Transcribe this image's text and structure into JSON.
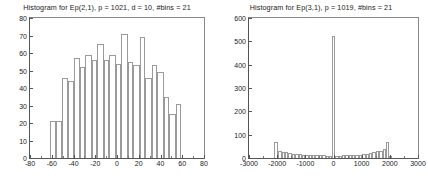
{
  "figure": {
    "background": "#ffffff",
    "axis_color": "#555555",
    "bar_edge_color": "#9a9a9a",
    "bar_fill_color": "#ffffff",
    "text_color": "#1a1a1a"
  },
  "charts": [
    {
      "id": "histogram-ep21",
      "title": "Histogram for Ep(2,1), p = 1021, d = 10, #bins = 21",
      "xticklabels": [
        "-80",
        "-60",
        "-40",
        "-20",
        "0",
        "20",
        "40",
        "60",
        "80"
      ],
      "yticklabels": [
        "0",
        "10",
        "20",
        "30",
        "40",
        "50",
        "60",
        "70",
        "80"
      ]
    },
    {
      "id": "histogram-ep31",
      "title": "Histogram for Ep(3,1), p = 1019, #bins = 21",
      "xticklabels": [
        "-3000",
        "-2000",
        "-1000",
        "0",
        "1000",
        "2000",
        "3000"
      ],
      "yticklabels": [
        "0",
        "100",
        "200",
        "300",
        "400",
        "500",
        "600"
      ]
    }
  ],
  "chart_data": [
    {
      "type": "bar",
      "id": "histogram-ep21",
      "title": "Histogram for Ep(2,1), p = 1021, d = 10, #bins = 21",
      "xlabel": "",
      "ylabel": "",
      "xlim": [
        -80,
        80
      ],
      "ylim": [
        0,
        80
      ],
      "xticks": [
        -80,
        -60,
        -40,
        -20,
        0,
        20,
        40,
        60,
        80
      ],
      "yticks": [
        0,
        10,
        20,
        30,
        40,
        50,
        60,
        70,
        80
      ],
      "grid": false,
      "legend": null,
      "bin_count": 21,
      "bin_width": 5.5,
      "bin_centers": [
        -59.5,
        -54,
        -48.5,
        -43,
        -37.5,
        -32,
        -26.5,
        -21,
        -15.5,
        -10,
        -4.5,
        1,
        6.5,
        12,
        17.5,
        23,
        28.5,
        34,
        39.5,
        45,
        50.5,
        56,
        61.5
      ],
      "categories": [
        "-62",
        "-57",
        "-51",
        "-46",
        "-40",
        "-35",
        "-29",
        "-24",
        "-18",
        "-13",
        "-7",
        "-2",
        "4",
        "9",
        "15",
        "20",
        "26",
        "31",
        "37",
        "42",
        "48",
        "53",
        "59"
      ],
      "values": [
        21,
        21,
        46,
        44,
        57,
        52,
        59,
        56,
        65,
        56,
        59,
        54,
        71,
        55,
        53,
        69,
        46,
        53,
        49,
        35,
        25,
        31
      ],
      "bars": [
        {
          "x_start": -62,
          "x_end": -56,
          "height": 21
        },
        {
          "x_start": -56,
          "x_end": -51,
          "height": 21
        },
        {
          "x_start": -51,
          "x_end": -45,
          "height": 46
        },
        {
          "x_start": -45,
          "x_end": -40,
          "height": 44
        },
        {
          "x_start": -40,
          "x_end": -34,
          "height": 57
        },
        {
          "x_start": -34,
          "x_end": -29,
          "height": 52
        },
        {
          "x_start": -29,
          "x_end": -23,
          "height": 59
        },
        {
          "x_start": -23,
          "x_end": -18,
          "height": 56
        },
        {
          "x_start": -18,
          "x_end": -12,
          "height": 65
        },
        {
          "x_start": -12,
          "x_end": -7,
          "height": 56
        },
        {
          "x_start": -7,
          "x_end": -1,
          "height": 59
        },
        {
          "x_start": -1,
          "x_end": 4,
          "height": 54
        },
        {
          "x_start": 4,
          "x_end": 10,
          "height": 71
        },
        {
          "x_start": 10,
          "x_end": 15,
          "height": 55
        },
        {
          "x_start": 15,
          "x_end": 21,
          "height": 53
        },
        {
          "x_start": 21,
          "x_end": 26,
          "height": 69
        },
        {
          "x_start": 26,
          "x_end": 32,
          "height": 46
        },
        {
          "x_start": 32,
          "x_end": 37,
          "height": 53
        },
        {
          "x_start": 37,
          "x_end": 43,
          "height": 49
        },
        {
          "x_start": 43,
          "x_end": 48,
          "height": 35
        },
        {
          "x_start": 48,
          "x_end": 54,
          "height": 25
        },
        {
          "x_start": 54,
          "x_end": 59,
          "height": 31
        }
      ]
    },
    {
      "type": "bar",
      "id": "histogram-ep31",
      "title": "Histogram for Ep(3,1), p = 1019, #bins = 21",
      "xlabel": "",
      "ylabel": "",
      "xlim": [
        -3000,
        3000
      ],
      "ylim": [
        0,
        600
      ],
      "xticks": [
        -3000,
        -2000,
        -1000,
        0,
        1000,
        2000,
        3000
      ],
      "yticks": [
        0,
        100,
        200,
        300,
        400,
        500,
        600
      ],
      "grid": false,
      "legend": null,
      "bin_count": 21,
      "categories": [
        "-2050",
        "-1900",
        "-1750",
        "-1600",
        "-1450",
        "-1300",
        "-1150",
        "-1000",
        "-850",
        "-700",
        "-550",
        "-400",
        "-250",
        "-100",
        "50",
        "200",
        "350",
        "500",
        "650",
        "800",
        "950",
        "1100",
        "1250",
        "1400",
        "1550",
        "1700",
        "1850",
        "2000"
      ],
      "values": [
        70,
        28,
        26,
        24,
        22,
        19,
        18,
        16,
        15,
        14,
        13,
        12,
        11,
        525,
        10,
        10,
        11,
        12,
        13,
        14,
        16,
        18,
        20,
        24,
        30,
        38,
        70,
        8
      ],
      "bars": [
        {
          "x_start": -2100,
          "x_end": -1960,
          "height": 70
        },
        {
          "x_start": -1960,
          "x_end": -1840,
          "height": 28
        },
        {
          "x_start": -1840,
          "x_end": -1720,
          "height": 26
        },
        {
          "x_start": -1720,
          "x_end": -1600,
          "height": 24
        },
        {
          "x_start": -1600,
          "x_end": -1480,
          "height": 22
        },
        {
          "x_start": -1480,
          "x_end": -1360,
          "height": 19
        },
        {
          "x_start": -1360,
          "x_end": -1240,
          "height": 18
        },
        {
          "x_start": -1240,
          "x_end": -1120,
          "height": 16
        },
        {
          "x_start": -1120,
          "x_end": -1000,
          "height": 15
        },
        {
          "x_start": -1000,
          "x_end": -880,
          "height": 14
        },
        {
          "x_start": -880,
          "x_end": -760,
          "height": 13
        },
        {
          "x_start": -760,
          "x_end": -640,
          "height": 12
        },
        {
          "x_start": -640,
          "x_end": -520,
          "height": 12
        },
        {
          "x_start": -520,
          "x_end": -400,
          "height": 11
        },
        {
          "x_start": -400,
          "x_end": -280,
          "height": 11
        },
        {
          "x_start": -280,
          "x_end": -160,
          "height": 10
        },
        {
          "x_start": -160,
          "x_end": -60,
          "height": 10
        },
        {
          "x_start": -60,
          "x_end": 60,
          "height": 525
        },
        {
          "x_start": 60,
          "x_end": 180,
          "height": 10
        },
        {
          "x_start": 180,
          "x_end": 300,
          "height": 10
        },
        {
          "x_start": 300,
          "x_end": 420,
          "height": 11
        },
        {
          "x_start": 420,
          "x_end": 540,
          "height": 11
        },
        {
          "x_start": 540,
          "x_end": 660,
          "height": 12
        },
        {
          "x_start": 660,
          "x_end": 780,
          "height": 13
        },
        {
          "x_start": 780,
          "x_end": 900,
          "height": 14
        },
        {
          "x_start": 900,
          "x_end": 1020,
          "height": 15
        },
        {
          "x_start": 1020,
          "x_end": 1140,
          "height": 16
        },
        {
          "x_start": 1140,
          "x_end": 1260,
          "height": 18
        },
        {
          "x_start": 1260,
          "x_end": 1380,
          "height": 20
        },
        {
          "x_start": 1380,
          "x_end": 1500,
          "height": 24
        },
        {
          "x_start": 1500,
          "x_end": 1620,
          "height": 28
        },
        {
          "x_start": 1620,
          "x_end": 1740,
          "height": 32
        },
        {
          "x_start": 1740,
          "x_end": 1860,
          "height": 38
        },
        {
          "x_start": 1860,
          "x_end": 1980,
          "height": 70
        },
        {
          "x_start": 1980,
          "x_end": 2060,
          "height": 8
        }
      ]
    }
  ]
}
